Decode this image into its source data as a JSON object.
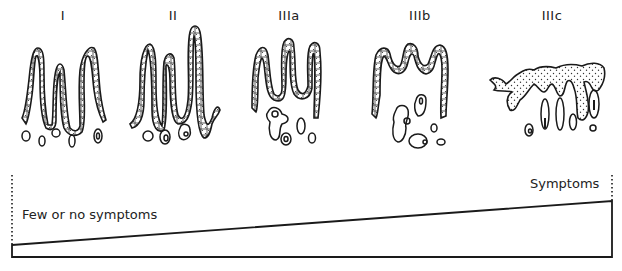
{
  "diagram": {
    "stages": [
      {
        "label": "I",
        "x": 63
      },
      {
        "label": "II",
        "x": 173
      },
      {
        "label": "IIIa",
        "x": 289
      },
      {
        "label": "IIIb",
        "x": 420
      },
      {
        "label": "IIIc",
        "x": 552
      }
    ],
    "scale": {
      "left_label": "Few or no symptoms",
      "right_label": "Symptoms"
    }
  }
}
